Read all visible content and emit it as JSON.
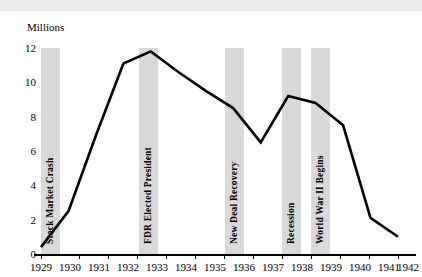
{
  "chart_data": {
    "type": "line",
    "title": "",
    "subtitle": "",
    "xlabel": "",
    "ylabel": "Millions",
    "unit_label": "Millions",
    "x": [
      1929,
      1930,
      1931,
      1932,
      1933,
      1934,
      1935,
      1936,
      1937,
      1938,
      1939,
      1940,
      1941,
      1942
    ],
    "values": [
      0.4,
      2.5,
      6.9,
      11.1,
      11.8,
      10.6,
      9.5,
      8.5,
      6.5,
      9.2,
      8.8,
      7.5,
      2.1,
      1.0
    ],
    "series": [
      {
        "name": "Unemployment",
        "values": [
          0.4,
          2.5,
          6.9,
          11.1,
          11.8,
          10.6,
          9.5,
          8.5,
          6.5,
          9.2,
          8.8,
          7.5,
          2.1,
          1.0
        ]
      }
    ],
    "xlim": [
      1929,
      1942
    ],
    "ylim": [
      0,
      12
    ],
    "xticks": [
      "1929",
      "1930",
      "1931",
      "1932",
      "1933",
      "1934",
      "1935",
      "1936",
      "1937",
      "1938",
      "1939",
      "1940",
      "1941",
      "1942"
    ],
    "yticks": [
      "0",
      "2",
      "4",
      "6",
      "8",
      "10",
      "12"
    ],
    "grid": false,
    "legend": "none",
    "line_color": "#000000",
    "band_color": "#d9d9d9",
    "annotations": [
      {
        "year": 1929,
        "label": "Stock Market Crash"
      },
      {
        "year": 1933,
        "label": "FDR Elected President"
      },
      {
        "year": 1936,
        "label": "New Deal Recovery"
      },
      {
        "year": 1938,
        "label": "Recession"
      },
      {
        "year": 1939,
        "label": "World War II Begins"
      }
    ]
  },
  "axis": {
    "unit": "Millions",
    "y_labels": [
      "12",
      "10",
      "8",
      "6",
      "4",
      "2",
      "0"
    ],
    "x_labels": [
      "1929",
      "1930",
      "1931",
      "1932",
      "1933",
      "1934",
      "1935",
      "1936",
      "1937",
      "1938",
      "1939",
      "1940",
      "1941",
      "1942"
    ]
  },
  "annotations": [
    "Stock Market Crash",
    "FDR Elected President",
    "New Deal Recovery",
    "Recession",
    "World War II Begins"
  ],
  "header": {
    "cropped_text": ""
  }
}
